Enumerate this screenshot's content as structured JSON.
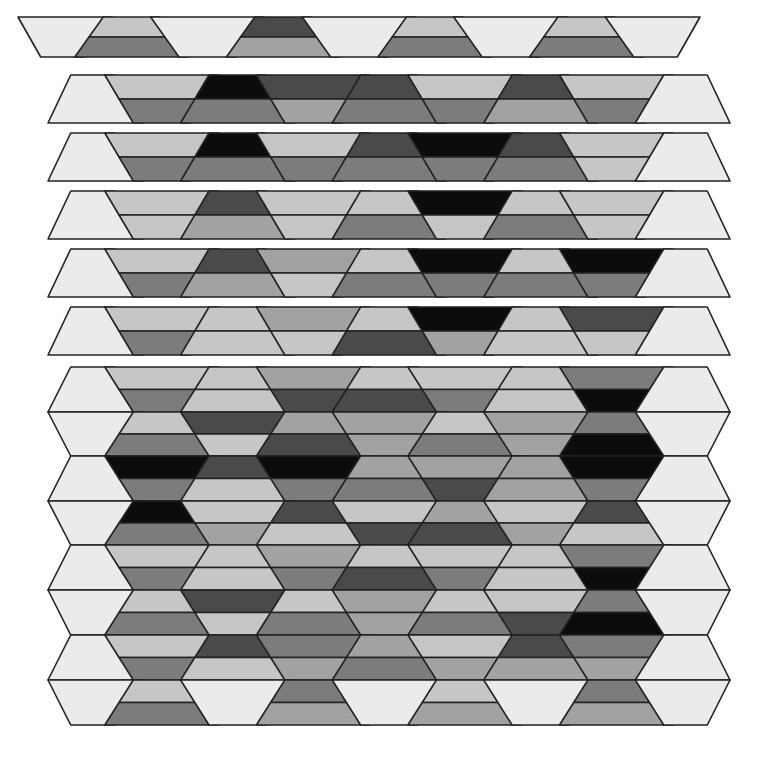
{
  "figure": {
    "description": "Grayscale tessellation of trapezoid rows with horizontally striped tiles",
    "palette": [
      "#ebebeb",
      "#c6c6c6",
      "#a2a2a2",
      "#7c7c7c",
      "#4a4a4a",
      "#0c0c0c"
    ],
    "stroke": "#222222",
    "tile_columns_x": [
      48,
      123,
      196,
      270,
      343,
      417,
      490,
      564,
      637,
      712
    ],
    "top_rows": [
      {
        "y0": 17,
        "y1": 57,
        "gap": true,
        "x_offset": -30,
        "tiles": [
          [
            0
          ],
          [
            1,
            3
          ],
          [
            0
          ],
          [
            4,
            2
          ],
          [
            0
          ],
          [
            1,
            3
          ],
          [
            0
          ],
          [
            1,
            3
          ],
          [
            0
          ]
        ]
      },
      {
        "y0": 75,
        "y1": 123,
        "gap": false,
        "x_offset": 0,
        "tiles": [
          [
            0
          ],
          [
            1,
            3
          ],
          [
            5,
            3
          ],
          [
            4,
            2
          ],
          [
            4,
            3
          ],
          [
            1,
            3
          ],
          [
            4,
            2
          ],
          [
            1,
            3
          ],
          [
            0
          ]
        ]
      },
      {
        "y0": 133,
        "y1": 181,
        "gap": false,
        "x_offset": 0,
        "tiles": [
          [
            0
          ],
          [
            1,
            3
          ],
          [
            5,
            3
          ],
          [
            1,
            3
          ],
          [
            4,
            3
          ],
          [
            5,
            3
          ],
          [
            4,
            3
          ],
          [
            1,
            1
          ],
          [
            0
          ]
        ]
      },
      {
        "y0": 191,
        "y1": 239,
        "gap": false,
        "x_offset": 0,
        "tiles": [
          [
            0
          ],
          [
            1,
            1
          ],
          [
            4,
            2
          ],
          [
            1,
            1
          ],
          [
            1,
            3
          ],
          [
            5,
            1
          ],
          [
            1,
            3
          ],
          [
            1,
            1
          ],
          [
            0
          ]
        ]
      },
      {
        "y0": 249,
        "y1": 297,
        "gap": false,
        "x_offset": 0,
        "tiles": [
          [
            0
          ],
          [
            1,
            3
          ],
          [
            4,
            2
          ],
          [
            2,
            1
          ],
          [
            1,
            3
          ],
          [
            5,
            3
          ],
          [
            1,
            3
          ],
          [
            5,
            3
          ],
          [
            0
          ]
        ]
      },
      {
        "y0": 307,
        "y1": 355,
        "gap": false,
        "x_offset": 0,
        "tiles": [
          [
            0
          ],
          [
            1,
            3
          ],
          [
            1,
            1
          ],
          [
            2,
            1
          ],
          [
            1,
            4
          ],
          [
            5,
            2
          ],
          [
            1,
            1
          ],
          [
            4,
            1
          ],
          [
            0
          ]
        ]
      }
    ],
    "dense_rows": [
      {
        "y0": 367,
        "y1": 412,
        "tiles": [
          [
            0
          ],
          [
            1,
            3
          ],
          [
            1,
            1
          ],
          [
            2,
            4
          ],
          [
            1,
            4
          ],
          [
            1,
            3
          ],
          [
            1,
            1
          ],
          [
            3,
            5
          ],
          [
            0
          ]
        ]
      },
      {
        "y0": 412,
        "y1": 456,
        "tiles": [
          [
            0
          ],
          [
            1,
            3
          ],
          [
            4,
            1
          ],
          [
            2,
            4
          ],
          [
            2,
            2
          ],
          [
            1,
            3
          ],
          [
            2,
            2
          ],
          [
            3,
            5
          ],
          [
            0
          ]
        ]
      },
      {
        "y0": 456,
        "y1": 501,
        "tiles": [
          [
            0
          ],
          [
            5,
            3
          ],
          [
            4,
            1
          ],
          [
            5,
            3
          ],
          [
            2,
            3
          ],
          [
            2,
            4
          ],
          [
            2,
            2
          ],
          [
            5,
            3
          ],
          [
            0
          ]
        ]
      },
      {
        "y0": 501,
        "y1": 545,
        "tiles": [
          [
            0
          ],
          [
            5,
            3
          ],
          [
            1,
            2
          ],
          [
            4,
            1
          ],
          [
            1,
            4
          ],
          [
            2,
            4
          ],
          [
            1,
            2
          ],
          [
            4,
            1
          ],
          [
            0
          ]
        ]
      },
      {
        "y0": 545,
        "y1": 590,
        "tiles": [
          [
            0
          ],
          [
            1,
            3
          ],
          [
            1,
            1
          ],
          [
            2,
            3
          ],
          [
            1,
            4
          ],
          [
            1,
            3
          ],
          [
            1,
            1
          ],
          [
            3,
            5
          ],
          [
            0
          ]
        ]
      },
      {
        "y0": 590,
        "y1": 635,
        "tiles": [
          [
            0
          ],
          [
            1,
            3
          ],
          [
            4,
            1
          ],
          [
            1,
            3
          ],
          [
            2,
            2
          ],
          [
            1,
            3
          ],
          [
            1,
            4
          ],
          [
            3,
            5
          ],
          [
            0
          ]
        ]
      },
      {
        "y0": 635,
        "y1": 680,
        "tiles": [
          [
            0
          ],
          [
            1,
            3
          ],
          [
            4,
            1
          ],
          [
            3,
            2
          ],
          [
            2,
            3
          ],
          [
            1,
            2
          ],
          [
            4,
            2
          ],
          [
            3,
            2
          ],
          [
            0
          ]
        ]
      },
      {
        "y0": 680,
        "y1": 725,
        "tiles": [
          [
            0
          ],
          [
            1,
            3
          ],
          [
            0
          ],
          [
            3,
            2
          ],
          [
            0
          ],
          [
            1,
            2
          ],
          [
            0
          ],
          [
            3,
            2
          ],
          [
            0
          ]
        ]
      }
    ]
  }
}
